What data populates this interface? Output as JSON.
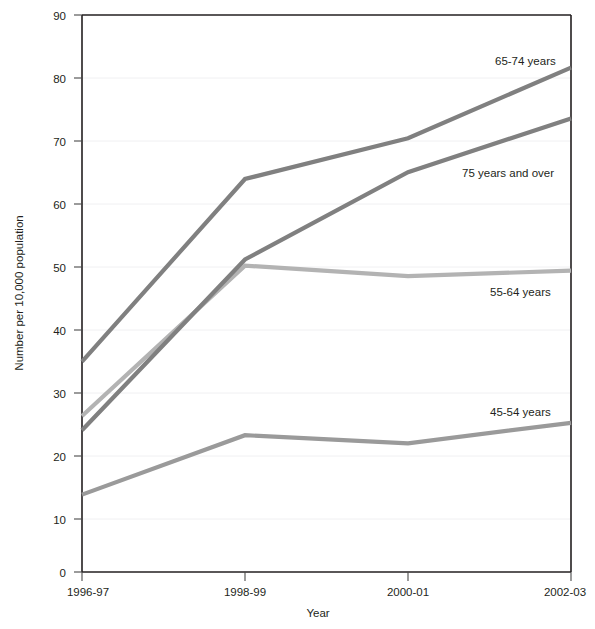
{
  "chart_data": {
    "type": "line",
    "title": "",
    "xlabel": "Year",
    "ylabel": "Number per 10,000 population",
    "categories": [
      "1996-97",
      "1998-99",
      "2000-01",
      "2002-03"
    ],
    "ylim": [
      0,
      90
    ],
    "yticks": [
      0,
      10,
      20,
      30,
      40,
      50,
      60,
      70,
      80,
      90
    ],
    "grid": true,
    "legend_position": "inline-right",
    "series": [
      {
        "name": "65-74 years",
        "values": [
          34.0,
          63.5,
          70.1,
          81.5
        ],
        "color": "#808080"
      },
      {
        "name": "75 years and over",
        "values": [
          22.9,
          50.5,
          64.6,
          73.3
        ],
        "color": "#808080"
      },
      {
        "name": "55-64 years",
        "values": [
          25.2,
          49.5,
          47.8,
          48.7
        ],
        "color": "#b3b3b3"
      },
      {
        "name": "45-54 years",
        "values": [
          12.5,
          22.1,
          20.8,
          24.1
        ],
        "color": "#9a9a9a"
      }
    ]
  },
  "axis": {
    "y_title": "Number per 10,000 population",
    "x_title": "Year",
    "y_tick_labels": [
      "90",
      "80",
      "70",
      "60",
      "50",
      "40",
      "30",
      "20",
      "10",
      "0"
    ],
    "x_tick_labels": [
      "1996-97",
      "1998-99",
      "2000-01",
      "2002-03"
    ]
  },
  "labels": {
    "s1": "65-74 years",
    "s2": "75 years and over",
    "s3": "55-64 years",
    "s4": "45-54 years"
  }
}
